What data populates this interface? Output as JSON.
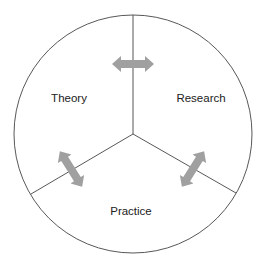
{
  "diagram": {
    "sections": [
      {
        "label": "Theory",
        "x": 69,
        "y": 98
      },
      {
        "label": "Research",
        "x": 201,
        "y": 98
      },
      {
        "label": "Practice",
        "x": 131,
        "y": 211
      }
    ],
    "arrow_color": "#a0a0a0",
    "line_color": "#444444",
    "arrows": [
      {
        "name": "theory-research-arrow",
        "between": [
          "Theory",
          "Research"
        ]
      },
      {
        "name": "theory-practice-arrow",
        "between": [
          "Theory",
          "Practice"
        ]
      },
      {
        "name": "research-practice-arrow",
        "between": [
          "Research",
          "Practice"
        ]
      }
    ]
  }
}
